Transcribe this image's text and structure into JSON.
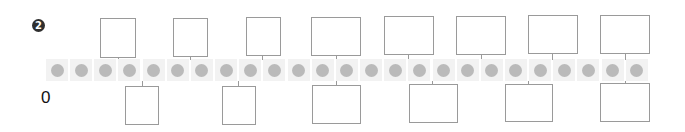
{
  "problem": {
    "marker_number": "2"
  },
  "number_line": {
    "start_label": "0",
    "tile_count": 25,
    "colors": {
      "tile": "#f2f2f2",
      "dot": "#bababa",
      "box_border": "#9a9a9a",
      "marker": "#2f2f2f"
    }
  },
  "answer_boxes": {
    "top": [
      "",
      "",
      "",
      "",
      "",
      "",
      "",
      ""
    ],
    "bottom": [
      "",
      "",
      "",
      "",
      "",
      ""
    ]
  }
}
